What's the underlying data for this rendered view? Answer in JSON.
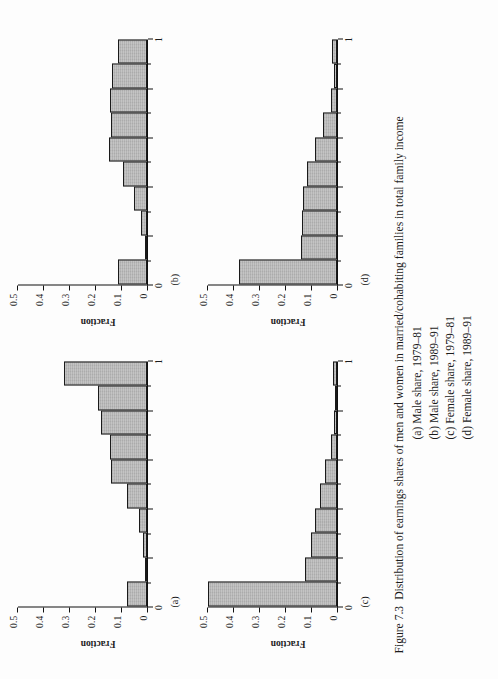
{
  "figure": {
    "number": "Figure 7.3",
    "caption": "Distribution of earnings shares of men and women in married/cohabiting families in total family income",
    "sub_captions": [
      "(a) Male share, 1979–81",
      "(b) Male share, 1989–91",
      "(c) Female  share, 1979–81",
      "(d) Female  share, 1989–91"
    ]
  },
  "axis": {
    "ylabel": "Fraction",
    "yticks": [
      "0",
      "0.1",
      "0.2",
      "0.3",
      "0.4",
      "0.5"
    ],
    "xticks": [
      "0",
      "1"
    ]
  },
  "chart_data": [
    {
      "type": "bar",
      "panel": "a",
      "tag": "(a)",
      "title": "(a) Male share, 1979–81",
      "xlabel": "",
      "ylabel": "Fraction",
      "ylim": [
        0,
        0.5
      ],
      "xlim": [
        0,
        1
      ],
      "yticks": [
        0,
        0.1,
        0.2,
        0.3,
        0.4,
        0.5
      ],
      "ytick_labels": [
        "0",
        "0.1",
        "0.2",
        "0.3",
        "0.4",
        "0.5"
      ],
      "xticks": [
        0,
        1
      ],
      "xtick_labels": [
        "0",
        "1"
      ],
      "grid": false,
      "legend": "none",
      "bin_edges": [
        0,
        0.1,
        0.2,
        0.3,
        0.4,
        0.5,
        0.6,
        0.7,
        0.8,
        0.9,
        1.0
      ],
      "categories": [
        "0-0.1",
        "0.1-0.2",
        "0.2-0.3",
        "0.3-0.4",
        "0.4-0.5",
        "0.5-0.6",
        "0.6-0.7",
        "0.7-0.8",
        "0.8-0.9",
        "0.9-1.0"
      ],
      "values": [
        0.079,
        0.004,
        0.017,
        0.031,
        0.076,
        0.138,
        0.145,
        0.178,
        0.19,
        0.32
      ]
    },
    {
      "type": "bar",
      "panel": "b",
      "tag": "(b)",
      "title": "(b) Male share, 1989–91",
      "xlabel": "",
      "ylabel": "Fraction",
      "ylim": [
        0,
        0.5
      ],
      "xlim": [
        0,
        1
      ],
      "yticks": [
        0,
        0.1,
        0.2,
        0.3,
        0.4,
        0.5
      ],
      "ytick_labels": [
        "0",
        "0.1",
        "0.2",
        "0.3",
        "0.4",
        "0.5"
      ],
      "xticks": [
        0,
        1
      ],
      "xtick_labels": [
        "0",
        "1"
      ],
      "grid": false,
      "legend": "none",
      "bin_edges": [
        0,
        0.1,
        0.2,
        0.3,
        0.4,
        0.5,
        0.6,
        0.7,
        0.8,
        0.9,
        1.0
      ],
      "categories": [
        "0-0.1",
        "0.1-0.2",
        "0.2-0.3",
        "0.3-0.4",
        "0.4-0.5",
        "0.5-0.6",
        "0.6-0.7",
        "0.7-0.8",
        "0.8-0.9",
        "0.9-1.0"
      ],
      "values": [
        0.112,
        0.004,
        0.022,
        0.05,
        0.093,
        0.148,
        0.14,
        0.145,
        0.135,
        0.112
      ]
    },
    {
      "type": "bar",
      "panel": "c",
      "tag": "(c)",
      "title": "(c) Female share, 1979–81",
      "xlabel": "",
      "ylabel": "Fraction",
      "ylim": [
        0,
        0.5
      ],
      "xlim": [
        0,
        1
      ],
      "yticks": [
        0,
        0.1,
        0.2,
        0.3,
        0.4,
        0.5
      ],
      "ytick_labels": [
        "0",
        "0.1",
        "0.2",
        "0.3",
        "0.4",
        "0.5"
      ],
      "xticks": [
        0,
        1
      ],
      "xtick_labels": [
        "0",
        "1"
      ],
      "grid": false,
      "legend": "none",
      "bin_edges": [
        0,
        0.1,
        0.2,
        0.3,
        0.4,
        0.5,
        0.6,
        0.7,
        0.8,
        0.9,
        1.0
      ],
      "categories": [
        "0-0.1",
        "0.1-0.2",
        "0.2-0.3",
        "0.3-0.4",
        "0.4-0.5",
        "0.5-0.6",
        "0.6-0.7",
        "0.7-0.8",
        "0.8-0.9",
        "0.9-1.0"
      ],
      "values": [
        0.5,
        0.125,
        0.1,
        0.085,
        0.065,
        0.045,
        0.022,
        0.012,
        0.008,
        0.015
      ]
    },
    {
      "type": "bar",
      "panel": "d",
      "tag": "(d)",
      "title": "(d) Female share, 1989–91",
      "xlabel": "",
      "ylabel": "Fraction",
      "ylim": [
        0,
        0.5
      ],
      "xlim": [
        0,
        1
      ],
      "yticks": [
        0,
        0.1,
        0.2,
        0.3,
        0.4,
        0.5
      ],
      "ytick_labels": [
        "0",
        "0.1",
        "0.2",
        "0.3",
        "0.4",
        "0.5"
      ],
      "xticks": [
        0,
        1
      ],
      "xtick_labels": [
        "0",
        "1"
      ],
      "grid": false,
      "legend": "none",
      "bin_edges": [
        0,
        0.1,
        0.2,
        0.3,
        0.4,
        0.5,
        0.6,
        0.7,
        0.8,
        0.9,
        1.0
      ],
      "categories": [
        "0-0.1",
        "0.1-0.2",
        "0.2-0.3",
        "0.3-0.4",
        "0.4-0.5",
        "0.5-0.6",
        "0.6-0.7",
        "0.7-0.8",
        "0.8-0.9",
        "0.9-1.0"
      ],
      "values": [
        0.38,
        0.14,
        0.135,
        0.13,
        0.115,
        0.085,
        0.055,
        0.025,
        0.013,
        0.018
      ]
    }
  ],
  "style": {
    "bar_fill": "#b4b4b4",
    "bar_stroke": "#1a1a1a",
    "axis_color": "#111111",
    "text_color": "#1b1b1b",
    "page_background": "#fdfdfd"
  }
}
